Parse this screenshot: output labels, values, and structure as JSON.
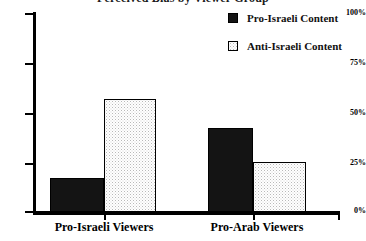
{
  "chart_data": {
    "type": "bar",
    "title": "Perceived Bias by Viewer Group",
    "xlabel": "",
    "ylabel": "",
    "categories": [
      "Pro-Israeli Viewers",
      "Pro-Arab Viewers"
    ],
    "series": [
      {
        "name": "Pro-Israeli Content",
        "values": [
          17,
          42
        ],
        "fill": "solid",
        "color": "#141414"
      },
      {
        "name": "Anti-Israeli Content",
        "values": [
          57,
          25
        ],
        "fill": "dotted",
        "color": "#ffffff"
      }
    ],
    "ylim": [
      0,
      100
    ],
    "yticks": [
      0,
      25,
      50,
      75,
      100
    ],
    "ytick_labels": [
      "0%",
      "25%",
      "50%",
      "75%",
      "100%"
    ],
    "grid": false,
    "legend_position": "top-right"
  },
  "axis": {
    "y_labels": [
      "100%",
      "75%",
      "50%",
      "25%",
      "0%"
    ]
  },
  "legend": {
    "items": [
      {
        "label": "Pro-Israeli Content"
      },
      {
        "label": "Anti-Israeli Content"
      }
    ]
  },
  "groups": [
    {
      "label": "Pro-Israeli Viewers"
    },
    {
      "label": "Pro-Arab Viewers"
    }
  ]
}
